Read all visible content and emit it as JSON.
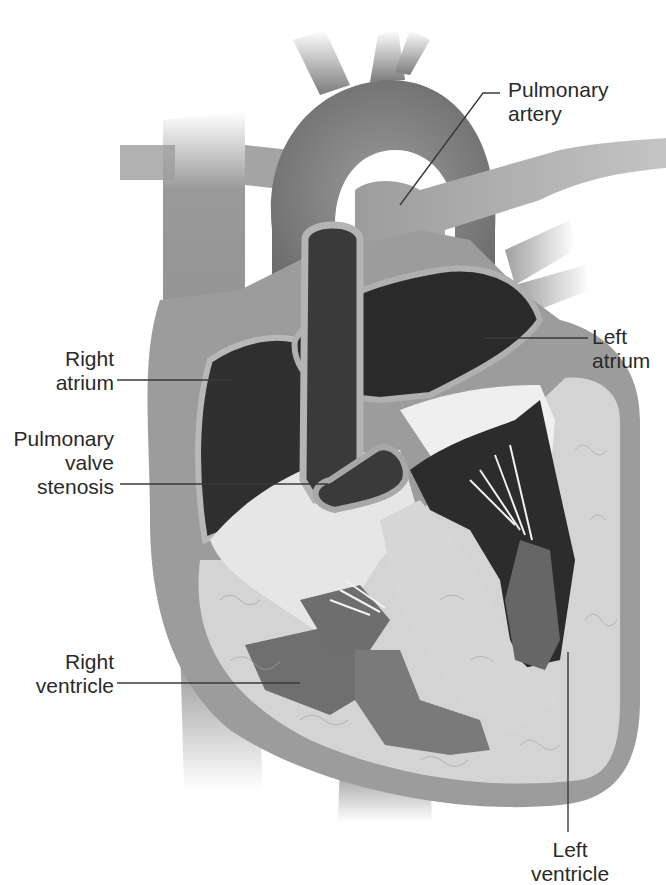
{
  "diagram": {
    "labels": [
      {
        "id": "pulmonary-artery",
        "text": "Pulmonary\nartery"
      },
      {
        "id": "left-atrium",
        "text": "Left\natrium"
      },
      {
        "id": "right-atrium",
        "text": "Right\natrium"
      },
      {
        "id": "pulmonary-valve-stenosis",
        "text": "Pulmonary\nvalve\nstenosis"
      },
      {
        "id": "right-ventricle",
        "text": "Right\nventricle"
      },
      {
        "id": "left-ventricle",
        "text": "Left\nventricle"
      }
    ],
    "colors": {
      "background": "#ffffff",
      "vessel": "#8a8a8a",
      "vessel_dark": "#6e6e6e",
      "wall": "#9c9c9c",
      "wall_light": "#b8b8b8",
      "chamber_dark": "#2e2e2e",
      "myocardium": "#d2d2d2",
      "valve_light": "#efefef",
      "papillary": "#6a6a6a",
      "label_text": "#2a2a2a",
      "leader_line": "#3a3a3a"
    }
  }
}
